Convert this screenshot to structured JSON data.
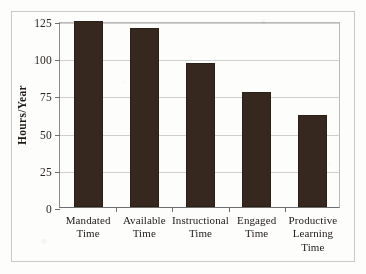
{
  "chart_data": {
    "type": "bar",
    "title": "",
    "xlabel": "",
    "ylabel": "Hours/Year",
    "categories": [
      "Mandated\nTime",
      "Available\nTime",
      "Instructional\nTime",
      "Engaged\nTime",
      "Productive\nLearning\nTime"
    ],
    "category_lines": [
      [
        "Mandated",
        "Time"
      ],
      [
        "Available",
        "Time"
      ],
      [
        "Instructional",
        "Time"
      ],
      [
        "Engaged",
        "Time"
      ],
      [
        "Productive",
        "Learning",
        "Time"
      ]
    ],
    "values": [
      125,
      120,
      97,
      77,
      62
    ],
    "ylim": [
      0,
      125
    ],
    "yticks": [
      0,
      25,
      50,
      75,
      100,
      125
    ],
    "ytick_labels": [
      "0",
      "25",
      "50",
      "75",
      "100",
      "125"
    ],
    "grid": true,
    "legend": "none",
    "bar_color": "#36281f",
    "grid_color": "#cfcfcd",
    "axis_color": "#6e6e6c",
    "frame_color": "#c9c9c7",
    "background": "#fdfdfc"
  }
}
